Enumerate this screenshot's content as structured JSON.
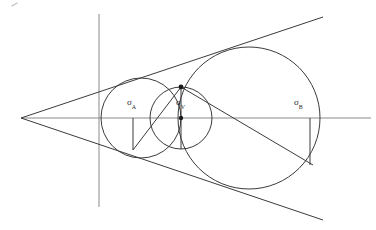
{
  "figure": {
    "type": "geometry-diagram",
    "title": "",
    "background_color": "#ffffff",
    "stroke_color": "#3b3b3b",
    "axis_color": "#8a8a8a",
    "point_color": "#1a1a1a",
    "width": 376,
    "height": 230
  },
  "labels": {
    "circle_a": {
      "symbol": "σ",
      "subscript": "A",
      "x": 127,
      "y": 98
    },
    "circle_v": {
      "symbol": "σ",
      "subscript": "V",
      "x": 176,
      "y": 98
    },
    "circle_b": {
      "symbol": "σ",
      "subscript": "B",
      "x": 294,
      "y": 98
    }
  },
  "geometry": {
    "apex": {
      "x": 21,
      "y": 118
    },
    "horizontal_axis": {
      "x1": 21,
      "y1": 118,
      "x2": 371,
      "y2": 118
    },
    "vertical_axis": {
      "x1": 99,
      "y1": 14,
      "x2": 99,
      "y2": 207
    },
    "circle_a": {
      "cx": 141,
      "cy": 118,
      "r": 40
    },
    "circle_b": {
      "cx": 249,
      "cy": 118,
      "r": 71
    },
    "circle_v": {
      "cx": 181,
      "cy": 118,
      "r": 31
    },
    "tangent_upper": {
      "x1": 21,
      "y1": 118,
      "x2": 323,
      "y2": 17
    },
    "tangent_lower": {
      "x1": 21,
      "y1": 118,
      "x2": 323,
      "y2": 220
    },
    "chord_line": {
      "x1": 133,
      "y1": 150,
      "x2": 181,
      "y2": 87
    },
    "secant_line": {
      "x1": 181,
      "y1": 87,
      "x2": 313,
      "y2": 165
    },
    "radius_a_drop": {
      "x1": 133,
      "y1": 118,
      "x2": 133,
      "y2": 150
    },
    "radius_v_drop": {
      "x1": 181,
      "y1": 87,
      "x2": 181,
      "y2": 149
    },
    "radius_b_drop": {
      "x1": 310,
      "y1": 118,
      "x2": 310,
      "y2": 165
    },
    "points": [
      {
        "name": "tangency-point-v",
        "x": 181,
        "y": 87
      },
      {
        "name": "center-point-v",
        "x": 181,
        "y": 118
      }
    ]
  }
}
